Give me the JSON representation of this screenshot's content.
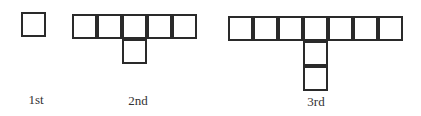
{
  "figures": [
    {
      "label": "1st",
      "origin": [
        21,
        12
      ],
      "cells": [
        [
          0,
          0
        ]
      ],
      "label_pos": [
        36,
        92
      ]
    },
    {
      "label": "2nd",
      "origin": [
        72,
        14
      ],
      "cells": [
        [
          0,
          0
        ],
        [
          1,
          0
        ],
        [
          2,
          0
        ],
        [
          3,
          0
        ],
        [
          4,
          0
        ],
        [
          2,
          1
        ]
      ],
      "label_pos": [
        138,
        93
      ]
    },
    {
      "label": "3rd",
      "origin": [
        228,
        16
      ],
      "cells": [
        [
          0,
          0
        ],
        [
          1,
          0
        ],
        [
          2,
          0
        ],
        [
          3,
          0
        ],
        [
          4,
          0
        ],
        [
          5,
          0
        ],
        [
          6,
          0
        ],
        [
          3,
          1
        ],
        [
          3,
          2
        ]
      ],
      "label_pos": [
        316,
        94
      ]
    }
  ],
  "style": {
    "line_color": "#2a2a2a",
    "cell_size": 25
  }
}
